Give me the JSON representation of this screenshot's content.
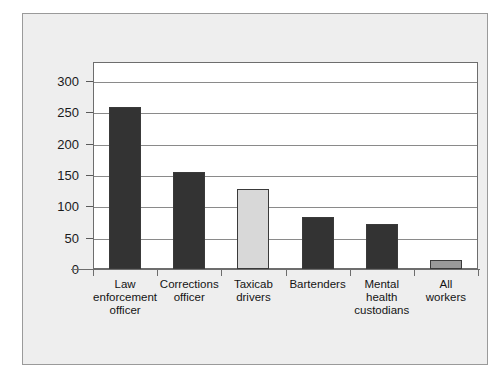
{
  "chart_data": {
    "type": "bar",
    "title": "",
    "subtitle": "",
    "xlabel": "",
    "ylabel": "",
    "ylim": [
      0,
      330
    ],
    "grid": true,
    "legend": "none",
    "yticks": [
      0,
      50,
      100,
      150,
      200,
      250,
      300
    ],
    "ytick_labels": [
      "0",
      "50",
      "100",
      "150",
      "200",
      "250",
      "300"
    ],
    "categories": [
      "Law enforcement officer",
      "Corrections officer",
      "Taxicab drivers",
      "Bartenders",
      "Mental health custodians",
      "All workers"
    ],
    "category_lines": [
      [
        "Law",
        "enforcement",
        "officer"
      ],
      [
        "Corrections",
        "officer"
      ],
      [
        "Taxicab",
        "drivers"
      ],
      [
        "Bartenders"
      ],
      [
        "Mental",
        "health",
        "custodians"
      ],
      [
        "All",
        "workers"
      ]
    ],
    "values": [
      258,
      155,
      127,
      83,
      72,
      14
    ],
    "bar_colors": [
      "#333333",
      "#333333",
      "#d8d8d8",
      "#333333",
      "#333333",
      "#999999"
    ]
  },
  "style": {
    "panel_background": "#eeeeee",
    "panel_border": "#9a9a9a",
    "plot_background": "#ffffff",
    "plot_border": "#6d6d6d",
    "gridline_color": "#8a8a8a",
    "text_color": "#141414"
  }
}
